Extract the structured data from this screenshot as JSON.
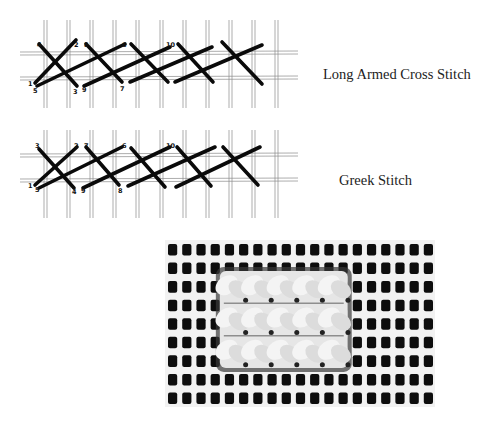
{
  "colors": {
    "background": "#ffffff",
    "grid": "#8a8a8a",
    "stitch": "#0a0a0a",
    "caption": "#222222",
    "canvas_dark": "#0d0d0d",
    "canvas_light": "#f2f2f2",
    "wool": "#e6e6e6"
  },
  "diagrams": [
    {
      "id": "long-armed-cross-stitch",
      "caption": "Long Armed Cross Stitch",
      "grid_x": [
        44,
        67,
        90,
        113,
        136,
        160,
        183,
        206,
        229,
        252,
        275
      ],
      "grid_y": [
        32,
        57
      ],
      "numbers": [
        {
          "label": "4",
          "x": 37,
          "y": 27
        },
        {
          "label": "2",
          "x": 74,
          "y": 27
        },
        {
          "label": "8",
          "x": 84,
          "y": 27
        },
        {
          "label": "6",
          "x": 122,
          "y": 27
        },
        {
          "label": "10",
          "x": 166,
          "y": 27
        },
        {
          "label": "1",
          "x": 28,
          "y": 66
        },
        {
          "label": "5",
          "x": 33,
          "y": 73
        },
        {
          "label": "3",
          "x": 73,
          "y": 74
        },
        {
          "label": "9",
          "x": 82,
          "y": 72
        },
        {
          "label": "7",
          "x": 120,
          "y": 71
        }
      ],
      "stitches": [
        [
          39,
          24,
          77,
          66
        ],
        [
          35,
          63,
          76,
          20
        ],
        [
          37,
          66,
          125,
          24
        ],
        [
          86,
          24,
          122,
          62
        ],
        [
          84,
          66,
          170,
          27
        ],
        [
          131,
          24,
          168,
          62
        ],
        [
          130,
          62,
          212,
          27
        ],
        [
          178,
          24,
          213,
          62
        ],
        [
          175,
          62,
          262,
          25
        ],
        [
          222,
          22,
          262,
          64
        ]
      ]
    },
    {
      "id": "greek-stitch",
      "caption": "Greek Stitch",
      "grid_x": [
        44,
        67,
        90,
        113,
        136,
        160,
        183,
        206,
        229,
        252,
        275
      ],
      "grid_y": [
        24,
        49
      ],
      "numbers": [
        {
          "label": "3",
          "x": 35,
          "y": 18
        },
        {
          "label": "2",
          "x": 74,
          "y": 18
        },
        {
          "label": "7",
          "x": 84,
          "y": 18
        },
        {
          "label": "6",
          "x": 122,
          "y": 18
        },
        {
          "label": "10",
          "x": 166,
          "y": 18
        },
        {
          "label": "1",
          "x": 28,
          "y": 58
        },
        {
          "label": "5",
          "x": 35,
          "y": 62
        },
        {
          "label": "4",
          "x": 72,
          "y": 64
        },
        {
          "label": "9",
          "x": 81,
          "y": 63
        },
        {
          "label": "8",
          "x": 118,
          "y": 63
        }
      ],
      "stitches": [
        [
          39,
          19,
          74,
          58
        ],
        [
          35,
          55,
          77,
          17
        ],
        [
          39,
          58,
          122,
          17
        ],
        [
          86,
          17,
          119,
          55
        ],
        [
          83,
          58,
          170,
          17
        ],
        [
          131,
          18,
          165,
          57
        ],
        [
          128,
          56,
          215,
          17
        ],
        [
          177,
          17,
          211,
          56
        ],
        [
          176,
          57,
          260,
          17
        ],
        [
          223,
          17,
          258,
          55
        ]
      ]
    }
  ],
  "photo": {
    "description": "Photograph of Greek stitch worked on canvas",
    "cols": 19,
    "rows": 9,
    "stitch_area": {
      "col_start": 4,
      "col_end": 13,
      "row_start": 2,
      "row_end": 7
    }
  }
}
